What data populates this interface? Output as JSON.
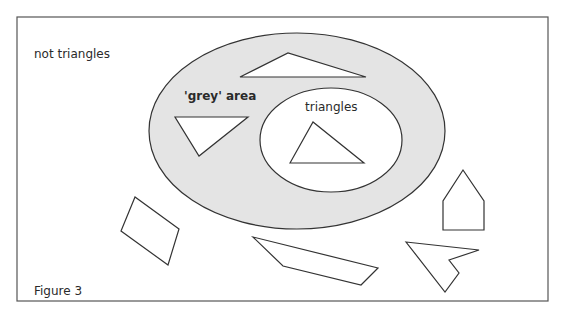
{
  "figure": {
    "caption": "Figure 3",
    "colors": {
      "frame": "#555555",
      "outline": "#333333",
      "grey_area_fill": "#e4e4e4",
      "inner_fill": "#ffffff",
      "text": "#2a2a2a"
    },
    "regions": {
      "outside_label": "not triangles",
      "grey_label": "'grey' area",
      "inner_label": "triangles"
    },
    "shapes": [
      {
        "name": "thin-triangle-grey-area",
        "region": "grey area",
        "points": "240,77 288,53 366,77"
      },
      {
        "name": "inverted-triangle-grey-area",
        "region": "grey area",
        "points": "175,117 248,117 199,156"
      },
      {
        "name": "triangle-inside",
        "region": "triangles",
        "points": "290,163 313,122 364,163"
      },
      {
        "name": "parallelogram",
        "region": "not triangles",
        "points": "135,197 121,231 168,265 179,229"
      },
      {
        "name": "long-quadrilateral",
        "region": "not triangles",
        "points": "253,237 283,266 361,285 378,268"
      },
      {
        "name": "house-pentagon",
        "region": "not triangles",
        "points": "443,230 443,201 463,170 484,201 484,230"
      },
      {
        "name": "arrowhead-shape",
        "region": "not triangles",
        "points": "406,242 479,250 449,260 459,273 445,292"
      }
    ]
  }
}
